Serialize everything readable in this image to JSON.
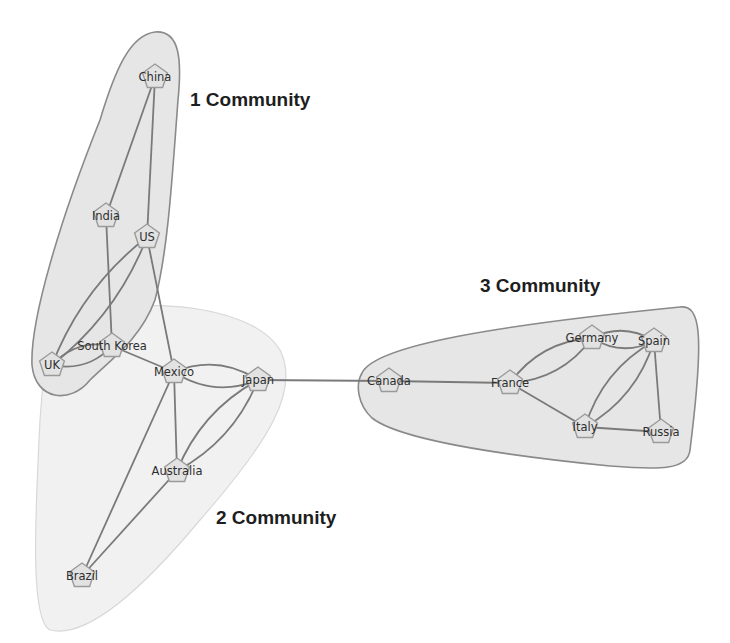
{
  "communities": [
    {
      "id": 1,
      "label": "1 Community",
      "label_x": 190,
      "label_y": 106
    },
    {
      "id": 2,
      "label": "2 Community",
      "label_x": 216,
      "label_y": 524
    },
    {
      "id": 3,
      "label": "3 Community",
      "label_x": 480,
      "label_y": 292
    }
  ],
  "nodes": [
    {
      "id": "china",
      "label": "China",
      "community": 1,
      "x": 155,
      "y": 77
    },
    {
      "id": "india",
      "label": "India",
      "community": 1,
      "x": 106,
      "y": 216
    },
    {
      "id": "us",
      "label": "US",
      "community": 1,
      "x": 147,
      "y": 237
    },
    {
      "id": "uk",
      "label": "UK",
      "community": 1,
      "x": 52,
      "y": 365
    },
    {
      "id": "south_korea",
      "label": "South Korea",
      "community": 2,
      "x": 112,
      "y": 346
    },
    {
      "id": "mexico",
      "label": "Mexico",
      "community": 2,
      "x": 174,
      "y": 372
    },
    {
      "id": "japan",
      "label": "Japan",
      "community": 2,
      "x": 258,
      "y": 380
    },
    {
      "id": "australia",
      "label": "Australia",
      "community": 2,
      "x": 177,
      "y": 471
    },
    {
      "id": "brazil",
      "label": "Brazil",
      "community": 2,
      "x": 82,
      "y": 576
    },
    {
      "id": "canada",
      "label": "Canada",
      "community": 3,
      "x": 389,
      "y": 381
    },
    {
      "id": "france",
      "label": "France",
      "community": 3,
      "x": 510,
      "y": 383
    },
    {
      "id": "germany",
      "label": "Germany",
      "community": 3,
      "x": 592,
      "y": 338
    },
    {
      "id": "spain",
      "label": "Spain",
      "community": 3,
      "x": 654,
      "y": 341
    },
    {
      "id": "italy",
      "label": "Italy",
      "community": 3,
      "x": 585,
      "y": 427
    },
    {
      "id": "russia",
      "label": "Russia",
      "community": 3,
      "x": 661,
      "y": 432
    }
  ],
  "edges": [
    [
      "china",
      "india"
    ],
    [
      "china",
      "us"
    ],
    [
      "india",
      "south_korea"
    ],
    [
      "us",
      "uk"
    ],
    [
      "us",
      "uk"
    ],
    [
      "us",
      "mexico"
    ],
    [
      "uk",
      "south_korea"
    ],
    [
      "uk",
      "south_korea"
    ],
    [
      "south_korea",
      "mexico"
    ],
    [
      "mexico",
      "japan"
    ],
    [
      "mexico",
      "japan"
    ],
    [
      "mexico",
      "australia"
    ],
    [
      "mexico",
      "brazil"
    ],
    [
      "japan",
      "australia"
    ],
    [
      "japan",
      "australia"
    ],
    [
      "australia",
      "brazil"
    ],
    [
      "japan",
      "canada"
    ],
    [
      "canada",
      "france"
    ],
    [
      "france",
      "germany"
    ],
    [
      "france",
      "germany"
    ],
    [
      "france",
      "italy"
    ],
    [
      "germany",
      "spain"
    ],
    [
      "germany",
      "spain"
    ],
    [
      "spain",
      "italy"
    ],
    [
      "spain",
      "italy"
    ],
    [
      "spain",
      "russia"
    ],
    [
      "italy",
      "russia"
    ]
  ]
}
